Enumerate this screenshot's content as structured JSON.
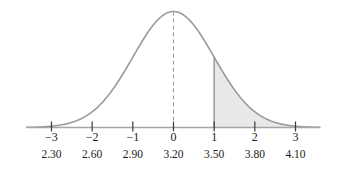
{
  "chart_data": {
    "type": "line",
    "title": "",
    "subtitle": "",
    "xlabel": "",
    "ylabel": "",
    "curve": "standard normal density",
    "mean_z": 0,
    "sd_z": 1,
    "mean_x": 3.2,
    "sd_x": 0.3,
    "xlim_z": [
      -3.6,
      3.6
    ],
    "ylim": [
      0,
      1
    ],
    "grid": false,
    "legend": false,
    "z_ticks": [
      -3,
      -2,
      -1,
      0,
      1,
      2,
      3
    ],
    "z_tick_labels": [
      "−3",
      "−2",
      "−1",
      "0",
      "1",
      "2",
      "3"
    ],
    "x_tick_labels": [
      "2.30",
      "2.60",
      "2.90",
      "3.20",
      "3.50",
      "3.80",
      "4.10"
    ],
    "center_line": {
      "at_z": 0,
      "at_x": "3.20",
      "style": "dashed"
    },
    "shaded_region": {
      "from_z": 1,
      "to_z": 3.6,
      "from_x": "3.50",
      "label": "right tail area",
      "fill": "#e8e8e8"
    },
    "colors": {
      "curve": "#9a9a9a",
      "axis": "#a6a6a6",
      "shade_fill": "#e9e9e9",
      "shade_edge": "#9a9a9a",
      "dashed_line": "#9a9a9a",
      "text": "#1c1c1c"
    }
  },
  "axis": {
    "name": "horizontal-axis",
    "z_row_name": "z-score-tick-labels",
    "x_row_name": "x-value-tick-labels"
  }
}
